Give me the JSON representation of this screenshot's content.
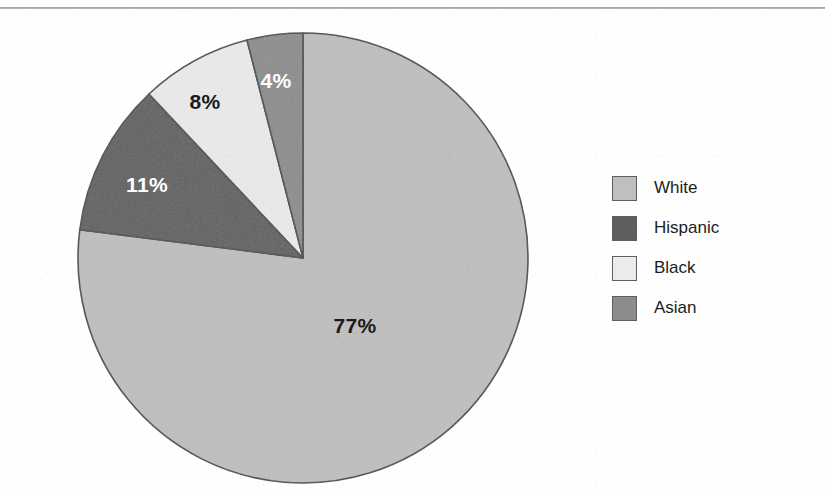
{
  "figure": {
    "width": 825,
    "height": 489,
    "background": "#fefefe",
    "top_rule_color": "#8e8e8e"
  },
  "chart_data": {
    "type": "pie",
    "title": "",
    "subtitle": "",
    "xlabel": "",
    "ylabel": "",
    "grid": false,
    "legend_position": "right",
    "start_angle_deg": 0,
    "direction": "clockwise",
    "categories": [
      "White",
      "Hispanic",
      "Black",
      "Asian"
    ],
    "values": [
      77,
      11,
      8,
      4
    ],
    "data_labels": [
      "77%",
      "11%",
      "8%",
      "4%"
    ],
    "units": "percent",
    "total": 100,
    "colors": [
      "#bfbfbf",
      "#5e5e5e",
      "#ebebeb",
      "#8c8c8c"
    ],
    "slice_outline_color": "#4a4a4a",
    "slices": [
      {
        "name": "White",
        "value": 77,
        "label": "77%",
        "color": "#bfbfbf",
        "label_color": "#1a1a1a",
        "label_x": 355,
        "label_y": 327
      },
      {
        "name": "Hispanic",
        "value": 11,
        "label": "11%",
        "color": "#5e5e5e",
        "label_color": "#ffffff",
        "label_x": 147,
        "label_y": 186
      },
      {
        "name": "Black",
        "value": 8,
        "label": "8%",
        "color": "#ebebeb",
        "label_color": "#1a1a1a",
        "label_x": 205,
        "label_y": 103
      },
      {
        "name": "Asian",
        "value": 4,
        "label": "4%",
        "color": "#8c8c8c",
        "label_color": "#ffffff",
        "label_x": 276,
        "label_y": 82
      }
    ],
    "geometry": {
      "center_x": 303,
      "center_y": 258,
      "radius": 225
    }
  },
  "legend": {
    "items": [
      {
        "label": "White",
        "color": "#bfbfbf"
      },
      {
        "label": "Hispanic",
        "color": "#5e5e5e"
      },
      {
        "label": "Black",
        "color": "#ebebeb"
      },
      {
        "label": "Asian",
        "color": "#8c8c8c"
      }
    ]
  }
}
